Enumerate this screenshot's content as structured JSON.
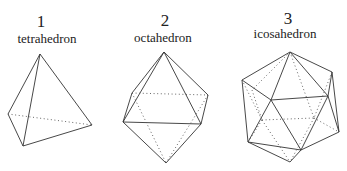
{
  "figure": {
    "solids": [
      {
        "number": "1",
        "name": "tetrahedron"
      },
      {
        "number": "2",
        "name": "octahedron"
      },
      {
        "number": "3",
        "name": "icosahedron"
      }
    ]
  }
}
